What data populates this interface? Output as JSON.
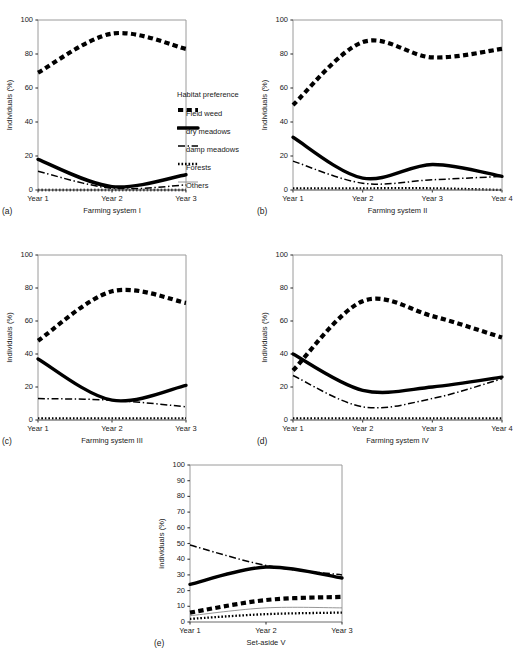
{
  "figure": {
    "legend": {
      "title": "Habitat preference",
      "entries": [
        {
          "label": "Field weed",
          "style": "thick-dashed"
        },
        {
          "label": "dry meadows",
          "style": "thick-solid"
        },
        {
          "label": "damp meadows",
          "style": "dash-dot"
        },
        {
          "label": "Forests",
          "style": "dotted"
        },
        {
          "label": "Others",
          "style": "thin-solid"
        }
      ]
    },
    "panels": [
      {
        "letter": "(a)",
        "xlabel": "Farming system I",
        "ylabel": "Individuals (%)"
      },
      {
        "letter": "(b)",
        "xlabel": "Farming system II",
        "ylabel": "Individuals (%)"
      },
      {
        "letter": "(c)",
        "xlabel": "Farming system III",
        "ylabel": "Individuals (%)"
      },
      {
        "letter": "(d)",
        "xlabel": "Farming system IV",
        "ylabel": "Individuals (%)"
      },
      {
        "letter": "(e)",
        "xlabel": "Set-aside V",
        "ylabel": "individuals (%)"
      }
    ]
  },
  "chart_data": [
    {
      "id": "a",
      "type": "line",
      "title": "Farming system I",
      "panel_letter": "(a)",
      "xlabel": "Farming system I",
      "ylabel": "Individuals (%)",
      "x": [
        "Year 1",
        "Year 2",
        "Year 3"
      ],
      "xticklabels": [
        "Year 1",
        "Year 2",
        "Year 3"
      ],
      "yticklabels": [
        "0",
        "20",
        "40",
        "60",
        "80",
        "100"
      ],
      "yticks": [
        0,
        20,
        40,
        60,
        80,
        100
      ],
      "ylim": [
        0,
        100
      ],
      "grid": false,
      "legend_position": "right-outside",
      "series": [
        {
          "name": "Field weed",
          "style": "thick-dashed",
          "values": [
            69,
            92,
            83
          ]
        },
        {
          "name": "dry meadows",
          "style": "thick-solid",
          "values": [
            18,
            2,
            9
          ]
        },
        {
          "name": "damp meadows",
          "style": "dash-dot",
          "values": [
            11,
            1,
            3
          ]
        },
        {
          "name": "Forests",
          "style": "dotted",
          "values": [
            0,
            0,
            0
          ]
        },
        {
          "name": "Others",
          "style": "thin-solid",
          "values": [
            0,
            0,
            0
          ]
        }
      ]
    },
    {
      "id": "b",
      "type": "line",
      "title": "Farming system II",
      "panel_letter": "(b)",
      "xlabel": "Farming system II",
      "ylabel": "Individuals (%)",
      "x": [
        "Year 1",
        "Year 2",
        "Year 3",
        "Year 4"
      ],
      "xticklabels": [
        "Year 1",
        "Year 2",
        "Year 3",
        "Year 4"
      ],
      "yticklabels": [
        "0",
        "20",
        "40",
        "60",
        "80",
        "100"
      ],
      "yticks": [
        0,
        20,
        40,
        60,
        80,
        100
      ],
      "ylim": [
        0,
        100
      ],
      "grid": false,
      "series": [
        {
          "name": "Field weed",
          "style": "thick-dashed",
          "values": [
            50,
            87,
            78,
            83
          ]
        },
        {
          "name": "dry meadows",
          "style": "thick-solid",
          "values": [
            31,
            7,
            15,
            8
          ]
        },
        {
          "name": "damp meadows",
          "style": "dash-dot",
          "values": [
            17,
            4,
            6,
            8
          ]
        },
        {
          "name": "Forests",
          "style": "dotted",
          "values": [
            1,
            1,
            1,
            0
          ]
        },
        {
          "name": "Others",
          "style": "thin-solid",
          "values": [
            0,
            0,
            0,
            0
          ]
        }
      ]
    },
    {
      "id": "c",
      "type": "line",
      "title": "Farming system III",
      "panel_letter": "(c)",
      "xlabel": "Farming system III",
      "ylabel": "Individuals (%)",
      "x": [
        "Year 1",
        "Year 2",
        "Year 3"
      ],
      "xticklabels": [
        "Year 1",
        "Year 2",
        "Year 3"
      ],
      "yticklabels": [
        "0",
        "20",
        "40",
        "60",
        "80",
        "100"
      ],
      "yticks": [
        0,
        20,
        40,
        60,
        80,
        100
      ],
      "ylim": [
        0,
        100
      ],
      "grid": false,
      "series": [
        {
          "name": "Field weed",
          "style": "thick-dashed",
          "values": [
            48,
            78,
            71
          ]
        },
        {
          "name": "dry meadows",
          "style": "thick-solid",
          "values": [
            37,
            12,
            21
          ]
        },
        {
          "name": "damp meadows",
          "style": "dash-dot",
          "values": [
            13,
            12,
            8
          ]
        },
        {
          "name": "Forests",
          "style": "dotted",
          "values": [
            1,
            1,
            1
          ]
        },
        {
          "name": "Others",
          "style": "thin-solid",
          "values": [
            0,
            0,
            0
          ]
        }
      ]
    },
    {
      "id": "d",
      "type": "line",
      "title": "Farming system IV",
      "panel_letter": "(d)",
      "xlabel": "Farming system IV",
      "ylabel": "Individuals (%)",
      "x": [
        "Year 1",
        "Year 2",
        "Year 3",
        "Year 4"
      ],
      "xticklabels": [
        "Year 1",
        "Year 2",
        "Year 3",
        "Year 4"
      ],
      "yticklabels": [
        "0",
        "20",
        "40",
        "60",
        "80",
        "100"
      ],
      "yticks": [
        0,
        20,
        40,
        60,
        80,
        100
      ],
      "ylim": [
        0,
        100
      ],
      "grid": false,
      "series": [
        {
          "name": "Field weed",
          "style": "thick-dashed",
          "values": [
            30,
            72,
            63,
            50
          ]
        },
        {
          "name": "dry meadows",
          "style": "thick-solid",
          "values": [
            40,
            18,
            20,
            26
          ]
        },
        {
          "name": "damp meadows",
          "style": "dash-dot",
          "values": [
            27,
            8,
            13,
            25
          ]
        },
        {
          "name": "Forests",
          "style": "dotted",
          "values": [
            1,
            1,
            1,
            1
          ]
        },
        {
          "name": "Others",
          "style": "thin-solid",
          "values": [
            0,
            0,
            0,
            0
          ]
        }
      ]
    },
    {
      "id": "e",
      "type": "line",
      "title": "Set-aside V",
      "panel_letter": "(e)",
      "xlabel": "Set-aside V",
      "ylabel": "individuals (%)",
      "x": [
        "Year 1",
        "Year 2",
        "Year 3"
      ],
      "xticklabels": [
        "Year 1",
        "Year 2",
        "Year 3"
      ],
      "yticklabels": [
        "0",
        "10",
        "20",
        "30",
        "40",
        "50",
        "60",
        "70",
        "80",
        "90",
        "100"
      ],
      "yticks": [
        0,
        10,
        20,
        30,
        40,
        50,
        60,
        70,
        80,
        90,
        100
      ],
      "ylim": [
        0,
        100
      ],
      "grid": false,
      "series": [
        {
          "name": "damp meadows",
          "style": "dash-dot",
          "values": [
            49,
            36,
            30
          ]
        },
        {
          "name": "dry meadows",
          "style": "thick-solid",
          "values": [
            24,
            35,
            28
          ]
        },
        {
          "name": "Field weed",
          "style": "thick-dashed",
          "values": [
            6,
            14,
            16
          ]
        },
        {
          "name": "Others",
          "style": "thin-solid",
          "values": [
            4,
            9,
            9
          ]
        },
        {
          "name": "Forests",
          "style": "dotted",
          "values": [
            2,
            5,
            6
          ]
        }
      ]
    }
  ]
}
